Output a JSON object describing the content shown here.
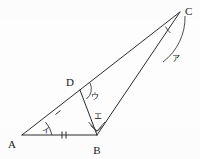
{
  "figure": {
    "background_color": "#fdfdfd",
    "line_color": "#2b2b2b",
    "label_color": "#1a1a1a"
  },
  "vertices": [
    {
      "id": "A",
      "label": "A",
      "x": 22,
      "y": 135,
      "label_x": 9,
      "label_y": 144
    },
    {
      "id": "B",
      "label": "B",
      "x": 97,
      "y": 135,
      "label_x": 93,
      "label_y": 152
    },
    {
      "id": "C",
      "label": "C",
      "x": 180,
      "y": 12,
      "label_x": 185,
      "label_y": 12
    },
    {
      "id": "D",
      "label": "D",
      "x": 80,
      "y": 90,
      "label_x": 68,
      "label_y": 84
    }
  ],
  "segments": [
    {
      "id": "AC",
      "from": "A",
      "to": "C",
      "ticks": 0
    },
    {
      "id": "AB",
      "from": "A",
      "to": "B",
      "ticks": 2
    },
    {
      "id": "BC",
      "from": "B",
      "to": "C",
      "ticks": 0
    },
    {
      "id": "DB",
      "from": "D",
      "to": "B",
      "ticks": 0
    }
  ],
  "tick_marks": [
    {
      "id": "tick-ad",
      "on_segment": "AD",
      "count": 1,
      "x": 58,
      "y": 113
    },
    {
      "id": "tick-ab",
      "on_segment": "AB",
      "count": 2,
      "x": 64,
      "y": 135
    }
  ],
  "angle_labels": [
    {
      "id": "a",
      "label": "ア",
      "at_vertex": "C",
      "x": 175,
      "y": 58
    },
    {
      "id": "i",
      "label": "イ",
      "at_vertex": "A",
      "x": 45,
      "y": 133
    },
    {
      "id": "u",
      "label": "ウ",
      "at_vertex": "D",
      "x": 93,
      "y": 98
    },
    {
      "id": "e",
      "label": "エ",
      "at_vertex": "B",
      "x": 97,
      "y": 118
    }
  ],
  "angle_arcs": [
    {
      "id": "arc-a-large",
      "at_vertex": "C",
      "note": "large arc for angle ア"
    },
    {
      "id": "arc-a-small",
      "at_vertex": "C",
      "note": "small arc between DC and BC"
    },
    {
      "id": "arc-i",
      "at_vertex": "A",
      "note": "arc for angle イ"
    },
    {
      "id": "arc-u",
      "at_vertex": "D",
      "note": "arc for angle ウ"
    },
    {
      "id": "arc-e",
      "at_vertex": "B",
      "note": "double arc for angle エ"
    }
  ]
}
